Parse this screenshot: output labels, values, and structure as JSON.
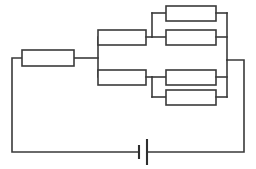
{
  "figure": {
    "type": "circuit-schematic",
    "width": 256,
    "height": 169,
    "background_color": "#ffffff",
    "wire_color": "#3a3a3a",
    "resistor_fill": "#ffffff",
    "battery_color": "#2e2e2e"
  },
  "watermarks": {
    "left": "",
    "right": ""
  },
  "components": {
    "series_resistor": {
      "name": "series-resistor",
      "label": "",
      "x": 22,
      "y": 50,
      "w": 52,
      "h": 16
    },
    "upper_branch_resistor": {
      "name": "upper-branch-resistor",
      "label": "",
      "x": 98,
      "y": 30,
      "w": 48,
      "h": 15
    },
    "upper_parallel_top": {
      "name": "upper-parallel-top-resistor",
      "label": "",
      "x": 166,
      "y": 6,
      "w": 50,
      "h": 15
    },
    "upper_parallel_bottom": {
      "name": "upper-parallel-bottom-resistor",
      "label": "",
      "x": 166,
      "y": 30,
      "w": 50,
      "h": 15
    },
    "lower_branch_resistor": {
      "name": "lower-branch-resistor",
      "label": "",
      "x": 98,
      "y": 70,
      "w": 48,
      "h": 15
    },
    "lower_parallel_top": {
      "name": "lower-parallel-top-resistor",
      "label": "",
      "x": 166,
      "y": 70,
      "w": 50,
      "h": 15
    },
    "lower_parallel_bottom": {
      "name": "lower-parallel-bottom-resistor",
      "label": "",
      "x": 166,
      "y": 90,
      "w": 50,
      "h": 15
    },
    "battery": {
      "name": "battery",
      "label": "",
      "x": 143,
      "y": 143
    }
  },
  "nodes": {
    "left_rail_x": 12,
    "right_rail_x": 244,
    "bottom_rail_y": 152,
    "split_node_x": 98,
    "merge_node_x": 227,
    "upper_row_y": 37,
    "lower_row_y": 77,
    "series_row_y": 58
  }
}
